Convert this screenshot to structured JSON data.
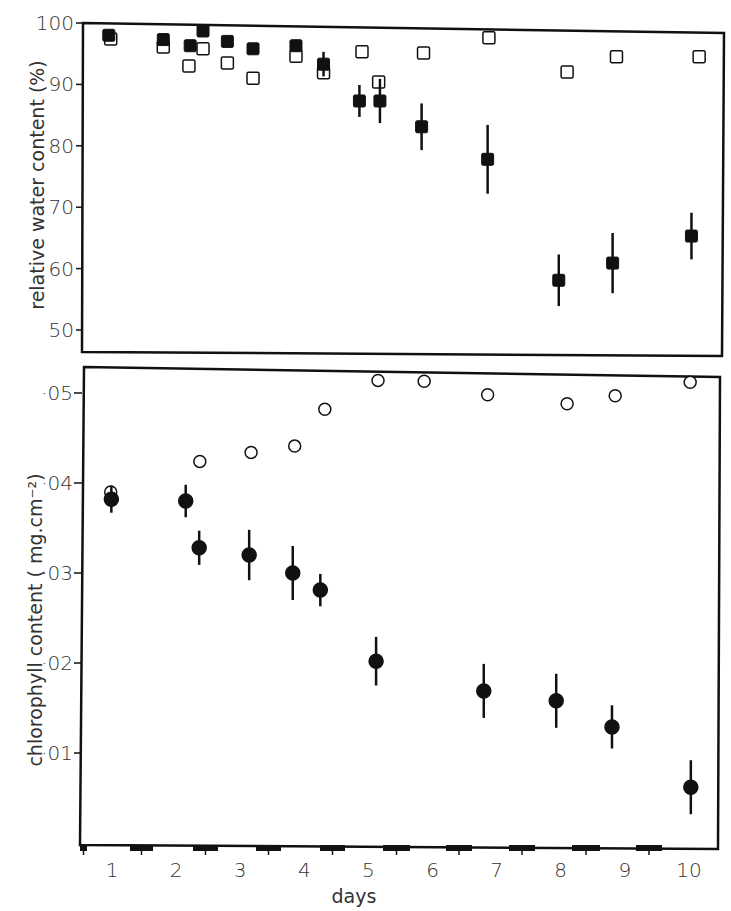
{
  "figure": {
    "x_axis_label": "days",
    "x_tick_labels": [
      "1",
      "2",
      "3",
      "4",
      "5",
      "6",
      "7",
      "8",
      "9",
      "10"
    ],
    "night_bars_px": [
      [
        80,
        87
      ],
      [
        130,
        153
      ],
      [
        193,
        218
      ],
      [
        256,
        281
      ],
      [
        320,
        345
      ],
      [
        383,
        410
      ],
      [
        446,
        472
      ],
      [
        509,
        535
      ],
      [
        572,
        600
      ],
      [
        636,
        662
      ]
    ]
  },
  "chart_data": [
    {
      "type": "scatter",
      "panel": "top",
      "title": "",
      "xlabel": "days",
      "ylabel": "relative water content (%)",
      "ylim": [
        47,
        100
      ],
      "yticks": [
        100,
        90,
        80,
        70,
        60,
        50
      ],
      "ytick_labels": [
        "100",
        "90",
        "80",
        "70",
        "60",
        "50"
      ],
      "xlim": [
        0.5,
        10.3
      ],
      "grid": false,
      "legend": "none",
      "series": [
        {
          "name": "stressed (filled squares)",
          "marker": "filled-square",
          "x": [
            0.95,
            1.8,
            2.22,
            2.42,
            2.8,
            3.2,
            3.87,
            4.3,
            4.86,
            5.18,
            5.83,
            6.86,
            7.97,
            8.81,
            10.04
          ],
          "y": [
            98.0,
            97.3,
            96.3,
            98.7,
            97.0,
            95.8,
            96.3,
            93.3,
            87.3,
            87.3,
            83.1,
            77.8,
            58.1,
            60.9,
            65.3
          ],
          "err": [
            0,
            0,
            0,
            0,
            0,
            0,
            0,
            2.0,
            2.6,
            3.6,
            3.8,
            5.6,
            4.2,
            4.9,
            3.8
          ]
        },
        {
          "name": "control (open squares)",
          "marker": "open-square",
          "x": [
            0.98,
            1.8,
            2.2,
            2.42,
            2.8,
            3.2,
            3.87,
            4.3,
            4.9,
            5.16,
            5.86,
            6.88,
            8.1,
            8.87,
            10.16
          ],
          "y": [
            97.4,
            96.1,
            93.0,
            95.8,
            93.5,
            91.0,
            94.6,
            91.9,
            95.3,
            90.4,
            95.1,
            97.6,
            92.0,
            94.5,
            94.5
          ],
          "err": [
            0,
            0,
            0,
            0,
            0,
            0,
            0,
            0,
            0,
            0,
            0,
            0,
            0,
            0,
            0
          ]
        }
      ]
    },
    {
      "type": "scatter",
      "panel": "bottom",
      "title": "",
      "xlabel": "days",
      "ylabel": "chlorophyll content ( mg.cm⁻²)",
      "ylim": [
        0,
        0.053
      ],
      "yticks": [
        0.05,
        0.04,
        0.03,
        0.02,
        0.01
      ],
      "ytick_labels": [
        "·05",
        "·04",
        "·03",
        "·02",
        "·01"
      ],
      "xlim": [
        0.5,
        10.3
      ],
      "grid": false,
      "legend": "none",
      "series": [
        {
          "name": "control (open circles)",
          "marker": "open-circle",
          "x": [
            0.98,
            2.37,
            3.17,
            3.85,
            4.32,
            5.15,
            5.87,
            6.86,
            8.1,
            8.85,
            10.02
          ],
          "y": [
            0.039,
            0.0424,
            0.0434,
            0.0441,
            0.0482,
            0.0514,
            0.0513,
            0.0498,
            0.0488,
            0.0497,
            0.0512
          ],
          "err": [
            0,
            0,
            0,
            0,
            0,
            0,
            0,
            0,
            0,
            0,
            0
          ]
        },
        {
          "name": "stressed (filled circles)",
          "marker": "filled-circle",
          "x": [
            0.99,
            2.15,
            2.36,
            3.14,
            3.82,
            4.25,
            5.12,
            6.8,
            7.93,
            8.8,
            10.03
          ],
          "y": [
            0.0382,
            0.038,
            0.0328,
            0.032,
            0.03,
            0.0281,
            0.0202,
            0.0169,
            0.0158,
            0.0129,
            0.0062
          ],
          "err": [
            0.0015,
            0.0018,
            0.0019,
            0.0028,
            0.003,
            0.0018,
            0.0027,
            0.003,
            0.003,
            0.0024,
            0.003
          ]
        }
      ]
    }
  ]
}
